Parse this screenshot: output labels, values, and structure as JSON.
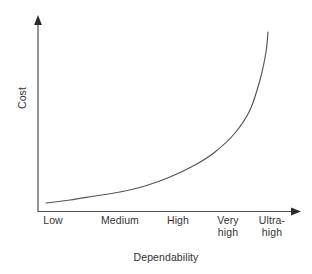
{
  "chart_data": {
    "type": "line",
    "title": "",
    "xlabel": "Dependability",
    "ylabel": "Cost",
    "categories": [
      "Low",
      "Medium",
      "High",
      "Very\nhigh",
      "Ultra-\nhigh"
    ],
    "tick_labels": [
      {
        "text": "Low",
        "x_px": 53
      },
      {
        "text": "Medium",
        "x_px": 120
      },
      {
        "text": "High",
        "x_px": 178
      },
      {
        "text": "Very\nhigh",
        "x_px": 228
      },
      {
        "text": "Ultra-\nhigh",
        "x_px": 272
      }
    ],
    "series": [
      {
        "name": "Cost",
        "x": [
          "Low",
          "Medium",
          "High",
          "Very high",
          "Ultra-high"
        ],
        "values": [
          2,
          8,
          22,
          52,
          100
        ],
        "description": "Cost rises exponentially as required dependability increases"
      }
    ],
    "curve_points_px": [
      [
        46,
        203
      ],
      [
        70,
        200
      ],
      [
        95,
        196
      ],
      [
        120,
        192
      ],
      [
        145,
        186
      ],
      [
        170,
        177
      ],
      [
        195,
        165
      ],
      [
        215,
        152
      ],
      [
        235,
        133
      ],
      [
        250,
        110
      ],
      [
        260,
        80
      ],
      [
        266,
        52
      ],
      [
        268,
        32
      ]
    ],
    "axes": {
      "x_axis_from_px": [
        38,
        212
      ],
      "x_axis_to_px": [
        300,
        211
      ],
      "y_axis_from_px": [
        38,
        212
      ],
      "y_axis_to_px": [
        38,
        17
      ],
      "arrows": true,
      "grid": false,
      "ticks_visible": false
    },
    "legend": {
      "visible": false,
      "entries": []
    },
    "colors": {
      "curve": "#555555",
      "axis": "#4d4d4d",
      "text": "#333333",
      "background": "#ffffff"
    },
    "xlim": [
      0,
      1
    ],
    "ylim": [
      0,
      1
    ],
    "annotations": []
  }
}
